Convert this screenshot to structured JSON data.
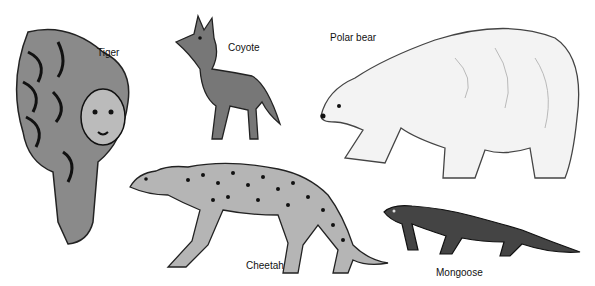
{
  "figure": {
    "animals": [
      {
        "name": "Tiger",
        "label": "Tiger"
      },
      {
        "name": "Coyote",
        "label": "Coyote"
      },
      {
        "name": "Polar bear",
        "label": "Polar bear"
      },
      {
        "name": "Cheetah",
        "label": "Cheetah"
      },
      {
        "name": "Mongoose",
        "label": "Mongoose"
      }
    ]
  }
}
